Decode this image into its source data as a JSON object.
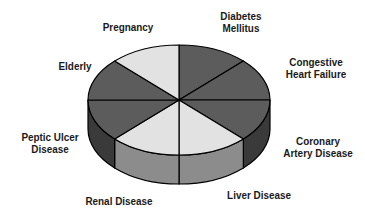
{
  "chart_data": {
    "type": "pie",
    "style": "3d",
    "title": "",
    "categories": [
      "Diabetes Mellitus",
      "Congestive Heart Failure",
      "Coronary Artery Disease",
      "Liver Disease",
      "Renal Disease",
      "Peptic Ulcer Disease",
      "Elderly",
      "Pregnancy"
    ],
    "values": [
      12.5,
      12.5,
      12.5,
      12.5,
      12.5,
      12.5,
      12.5,
      12.5
    ],
    "slice_shades": [
      "dark",
      "dark",
      "dark",
      "light",
      "light",
      "dark",
      "dark",
      "light"
    ],
    "legend": "none",
    "labels_position": "outside"
  },
  "colors": {
    "dark_top": "#5c5c5c",
    "light_top": "#e2e2e2",
    "dark_side": "#3a3a3a",
    "light_side": "#8c8c8c",
    "outline": "#000000"
  },
  "labels": {
    "diabetes": "Diabetes\nMellitus",
    "chf": "Congestive\nHeart Failure",
    "cad": "Coronary\nArtery Disease",
    "liver": "Liver Disease",
    "renal": "Renal Disease",
    "peptic": "Peptic Ulcer\nDisease",
    "elderly": "Elderly",
    "pregnancy": "Pregnancy"
  }
}
